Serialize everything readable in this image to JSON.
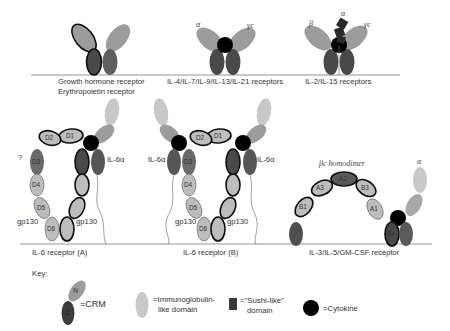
{
  "figure": {
    "panels": [
      {
        "id": "gh-epo",
        "labels": [
          "Growth hormone receptor",
          "Erythropoietin receptor"
        ]
      },
      {
        "id": "il4-family",
        "labels": [
          "IL-4/IL-7/IL-9/IL-13/IL-21 receptors"
        ],
        "chains": [
          "α",
          "γc"
        ]
      },
      {
        "id": "il2-family",
        "labels": [
          "IL-2/IL-15 receptors"
        ],
        "chains": [
          "β",
          "α",
          "γc"
        ]
      },
      {
        "id": "il6-a",
        "labels": [
          "IL-6 receptor (A)"
        ],
        "chains": [
          "IL-6α",
          "gp130",
          "gp130"
        ],
        "domains": [
          "D1",
          "D2",
          "D3",
          "D4",
          "D5",
          "D6"
        ],
        "side_mark": "?"
      },
      {
        "id": "il6-b",
        "labels": [
          "IL-6 receptor (B)"
        ],
        "chains": [
          "IL-6α",
          "IL-6α",
          "gp130",
          "gp130"
        ],
        "domains": [
          "D1",
          "D2",
          "D3",
          "D4",
          "D5",
          "D6"
        ]
      },
      {
        "id": "il3-family",
        "labels": [
          "IL-3/IL-5/GM-CSF receptor"
        ],
        "chains": [
          "βc homodimer",
          "α"
        ],
        "domains": [
          "A1",
          "A2",
          "A3",
          "B1",
          "B2",
          "B3",
          "B4"
        ]
      }
    ],
    "key": {
      "title": "Key:",
      "items": [
        {
          "symbol": "crm",
          "glyphs": [
            "N",
            "C"
          ],
          "label": "=CRM"
        },
        {
          "symbol": "ig-domain",
          "label_lines": [
            "=Immunoglobulin-",
            "like domain"
          ]
        },
        {
          "symbol": "sushi-domain",
          "label_lines": [
            "=\"Sushi-like\"",
            "domain"
          ]
        },
        {
          "symbol": "cytokine",
          "label": "=Cytokine"
        }
      ]
    },
    "colors": {
      "crm_c_domain": "#4a4a4a",
      "crm_n_domain": "#9c9c9c",
      "ig_domain": "#bdbdbd",
      "cytokine": "#050505",
      "membrane": "#888888"
    }
  }
}
